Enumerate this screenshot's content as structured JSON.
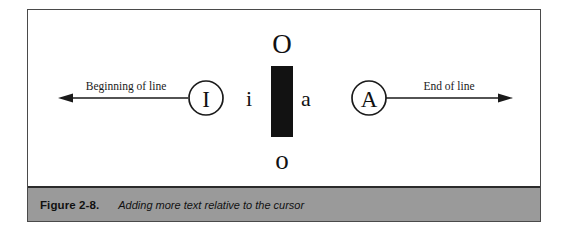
{
  "figure": {
    "caption_label": "Figure 2-8.",
    "caption_text": "Adding more text relative to the cursor",
    "caption_bar_color": "#9a9a9a",
    "frame_border_color": "#4a4a4a",
    "ink_color": "#1a1a1a",
    "background_color": "#ffffff"
  },
  "diagram": {
    "left_arrow_label": "Beginning of line",
    "right_arrow_label": "End of line",
    "left_command": "I",
    "right_command": "A",
    "glyph_above": "O",
    "glyph_left": "i",
    "glyph_right": "a",
    "glyph_below": "o",
    "cursor_block_color": "#121212"
  }
}
